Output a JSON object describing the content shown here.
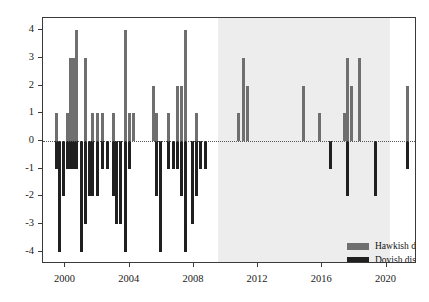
{
  "chart": {
    "title": "",
    "xlabel": "",
    "ylabel": "",
    "legend": {
      "hawkish_label": "Hawkish dissent",
      "dovish_label": "Dovish dissent"
    },
    "colors": {
      "hawkish": "#6f6f6f",
      "dovish": "#202020",
      "shading": "#ededed",
      "frame": "#3a3a3a"
    }
  },
  "chart_data": {
    "type": "bar",
    "title": "",
    "xlabel": "",
    "ylabel": "",
    "xlim": [
      1998.6,
      2021.9
    ],
    "ylim": [
      -4.45,
      4.45
    ],
    "grid": false,
    "legend_position": "lower right",
    "yticks": [
      4,
      3,
      2,
      1,
      0,
      -1,
      -2,
      -3,
      -4
    ],
    "ytick_labels": [
      "4",
      "3",
      "2",
      "1",
      "0",
      "-1",
      "-2",
      "-3",
      "-4"
    ],
    "xticks": [
      2000,
      2004,
      2008,
      2012,
      2016,
      2020
    ],
    "xtick_labels": [
      "2000",
      "2004",
      "2008",
      "2012",
      "2016",
      "2020"
    ],
    "shaded_region": {
      "start": 2009.5,
      "end": 2020.2,
      "color": "#ededed"
    },
    "zero_line": 0,
    "series": [
      {
        "name": "Hawkish dissent",
        "color": "#6f6f6f"
      },
      {
        "name": "Dovish dissent",
        "color": "#202020"
      }
    ],
    "bars": [
      {
        "x": 1999.45,
        "hawkish": 1,
        "dovish": -1
      },
      {
        "x": 1999.65,
        "hawkish": 0,
        "dovish": -4
      },
      {
        "x": 1999.85,
        "hawkish": 0,
        "dovish": -2
      },
      {
        "x": 2000.1,
        "hawkish": 1,
        "dovish": -1
      },
      {
        "x": 2000.3,
        "hawkish": 3,
        "dovish": -1
      },
      {
        "x": 2000.5,
        "hawkish": 3,
        "dovish": -1
      },
      {
        "x": 2000.7,
        "hawkish": 4,
        "dovish": -1
      },
      {
        "x": 2001.0,
        "hawkish": 0,
        "dovish": -4
      },
      {
        "x": 2001.25,
        "hawkish": 3,
        "dovish": -3
      },
      {
        "x": 2001.5,
        "hawkish": 0,
        "dovish": -2
      },
      {
        "x": 2001.7,
        "hawkish": 1,
        "dovish": -2
      },
      {
        "x": 2002.0,
        "hawkish": 1,
        "dovish": -2
      },
      {
        "x": 2002.3,
        "hawkish": 1,
        "dovish": -1
      },
      {
        "x": 2002.6,
        "hawkish": 0,
        "dovish": -1
      },
      {
        "x": 2003.0,
        "hawkish": 1,
        "dovish": -2
      },
      {
        "x": 2003.2,
        "hawkish": 0,
        "dovish": -3
      },
      {
        "x": 2003.45,
        "hawkish": 0,
        "dovish": -3
      },
      {
        "x": 2003.75,
        "hawkish": 4,
        "dovish": -4
      },
      {
        "x": 2004.0,
        "hawkish": 1,
        "dovish": -1
      },
      {
        "x": 2004.25,
        "hawkish": 1,
        "dovish": 0
      },
      {
        "x": 2005.5,
        "hawkish": 2,
        "dovish": 0
      },
      {
        "x": 2005.7,
        "hawkish": 1,
        "dovish": -2
      },
      {
        "x": 2005.9,
        "hawkish": 0,
        "dovish": -4
      },
      {
        "x": 2006.4,
        "hawkish": 1,
        "dovish": -1
      },
      {
        "x": 2006.7,
        "hawkish": 0,
        "dovish": -1
      },
      {
        "x": 2007.0,
        "hawkish": 2,
        "dovish": -1
      },
      {
        "x": 2007.25,
        "hawkish": 2,
        "dovish": -2
      },
      {
        "x": 2007.5,
        "hawkish": 4,
        "dovish": -4
      },
      {
        "x": 2007.9,
        "hawkish": 0,
        "dovish": -3
      },
      {
        "x": 2008.15,
        "hawkish": 1,
        "dovish": -2
      },
      {
        "x": 2008.4,
        "hawkish": 0,
        "dovish": -1
      },
      {
        "x": 2008.7,
        "hawkish": 0,
        "dovish": -1
      },
      {
        "x": 2010.8,
        "hawkish": 1,
        "dovish": 0
      },
      {
        "x": 2011.1,
        "hawkish": 3,
        "dovish": 0
      },
      {
        "x": 2011.35,
        "hawkish": 2,
        "dovish": 0
      },
      {
        "x": 2014.8,
        "hawkish": 2,
        "dovish": 0
      },
      {
        "x": 2015.8,
        "hawkish": 1,
        "dovish": 0
      },
      {
        "x": 2016.5,
        "hawkish": 0,
        "dovish": -1
      },
      {
        "x": 2017.4,
        "hawkish": 1,
        "dovish": 0
      },
      {
        "x": 2017.6,
        "hawkish": 3,
        "dovish": -2
      },
      {
        "x": 2017.8,
        "hawkish": 2,
        "dovish": 0
      },
      {
        "x": 2018.3,
        "hawkish": 3,
        "dovish": 0
      },
      {
        "x": 2019.3,
        "hawkish": 0,
        "dovish": -2
      },
      {
        "x": 2021.3,
        "hawkish": 2,
        "dovish": -1
      }
    ]
  }
}
